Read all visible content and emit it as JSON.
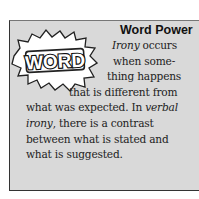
{
  "header": {
    "badge": "WORD",
    "title": "Word Power"
  },
  "body": {
    "line1_term": "Irony",
    "line1_rest": " occurs",
    "line2": "when some-",
    "line3": "thing happens",
    "line4": "that is different from",
    "line5_a": "what was expected. In ",
    "line5_term": "verbal",
    "line6_term": "irony",
    "line6_rest": ", there is a contrast",
    "line7": "between what is stated and",
    "line8": "what is suggested."
  },
  "colors": {
    "box": "#d9d9d9",
    "text": "#222222"
  }
}
